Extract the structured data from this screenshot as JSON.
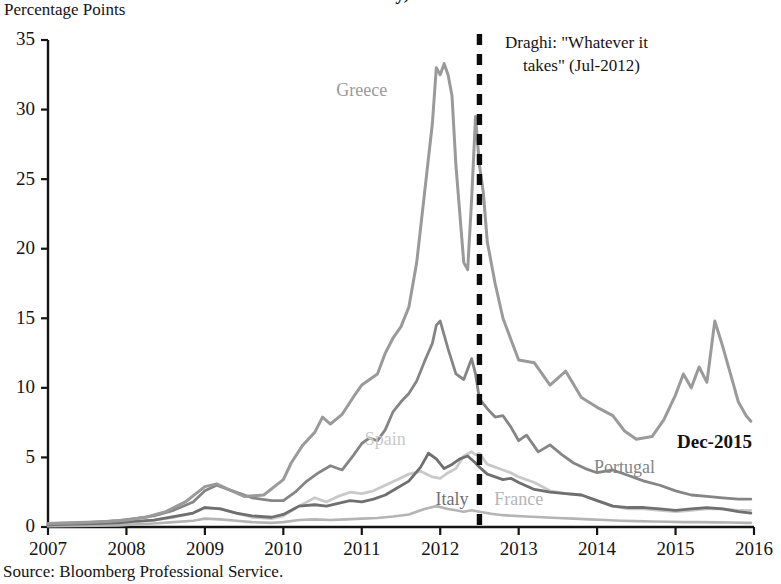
{
  "figure": {
    "title": "Over Germany, 2007–2015",
    "ylabel": "Percentage Points",
    "source_note": "Source: Bloomberg Professional Service."
  },
  "annotations": {
    "draghi_line1": "Draghi: \"Whatever it",
    "draghi_line2": "takes\" (Jul-2012)",
    "end_label": "Dec-2015"
  },
  "colors": {
    "greece": "#9a9a9a",
    "portugal": "#858585",
    "spain": "#c9c9c9",
    "italy": "#6f6f6f",
    "france": "#b4b4b4",
    "axis": "#141414",
    "event_line": "#0c0c0c",
    "background": "#ffffff"
  },
  "chart_data": {
    "type": "line",
    "title": "Over Germany, 2007–2015",
    "subtitle": "",
    "xlabel": "",
    "ylabel": "Percentage Points",
    "xlim": [
      2007,
      2016
    ],
    "ylim": [
      0,
      35
    ],
    "yticks": [
      0,
      5,
      10,
      15,
      20,
      25,
      30,
      35
    ],
    "xticks": [
      2007,
      2008,
      2009,
      2010,
      2011,
      2012,
      2013,
      2014,
      2015,
      2016
    ],
    "grid": false,
    "legend": "inline-labels",
    "annotations": [
      {
        "label": "Draghi: \"Whatever it takes\" (Jul-2012)",
        "x": 2012.5,
        "type": "vline-dashed"
      },
      {
        "label": "Dec-2015",
        "x": 2015.95,
        "y": 6.0,
        "type": "text"
      }
    ],
    "series": [
      {
        "name": "Greece",
        "color": "#9a9a9a",
        "label_x": 2011.0,
        "label_y": 31.0,
        "x": [
          2007.0,
          2007.25,
          2007.5,
          2007.75,
          2008.0,
          2008.25,
          2008.5,
          2008.75,
          2009.0,
          2009.15,
          2009.3,
          2009.5,
          2009.75,
          2010.0,
          2010.1,
          2010.25,
          2010.4,
          2010.5,
          2010.6,
          2010.75,
          2010.9,
          2011.0,
          2011.1,
          2011.2,
          2011.3,
          2011.4,
          2011.5,
          2011.6,
          2011.7,
          2011.8,
          2011.9,
          2011.95,
          2012.0,
          2012.05,
          2012.1,
          2012.15,
          2012.2,
          2012.3,
          2012.35,
          2012.4,
          2012.45,
          2012.5,
          2012.55,
          2012.6,
          2012.7,
          2012.8,
          2012.9,
          2013.0,
          2013.2,
          2013.4,
          2013.6,
          2013.8,
          2014.0,
          2014.2,
          2014.35,
          2014.5,
          2014.7,
          2014.85,
          2015.0,
          2015.1,
          2015.2,
          2015.3,
          2015.4,
          2015.5,
          2015.6,
          2015.7,
          2015.8,
          2015.9,
          2015.96
        ],
        "y": [
          0.25,
          0.3,
          0.35,
          0.4,
          0.5,
          0.7,
          1.1,
          1.8,
          2.9,
          3.1,
          2.7,
          2.2,
          2.3,
          3.4,
          4.6,
          5.9,
          6.8,
          7.9,
          7.4,
          8.1,
          9.4,
          10.2,
          10.6,
          11.0,
          12.5,
          13.6,
          14.4,
          15.8,
          19.0,
          24.0,
          29.0,
          33.0,
          32.5,
          33.3,
          32.5,
          31.0,
          26.0,
          19.0,
          18.5,
          23.5,
          29.5,
          26.0,
          24.0,
          20.5,
          17.5,
          15.0,
          13.5,
          12.0,
          11.8,
          10.2,
          11.2,
          9.3,
          8.6,
          8.0,
          6.9,
          6.3,
          6.5,
          7.7,
          9.5,
          11.0,
          10.0,
          11.5,
          10.4,
          14.8,
          13.0,
          11.0,
          9.0,
          8.0,
          7.6
        ]
      },
      {
        "name": "Portugal",
        "color": "#858585",
        "label_x": 2014.35,
        "label_y": 3.9,
        "x": [
          2007.0,
          2007.3,
          2007.6,
          2007.9,
          2008.1,
          2008.35,
          2008.6,
          2008.85,
          2009.0,
          2009.15,
          2009.35,
          2009.6,
          2009.85,
          2010.0,
          2010.15,
          2010.3,
          2010.45,
          2010.6,
          2010.75,
          2010.9,
          2011.0,
          2011.1,
          2011.2,
          2011.3,
          2011.4,
          2011.5,
          2011.6,
          2011.7,
          2011.8,
          2011.9,
          2011.95,
          2012.0,
          2012.1,
          2012.2,
          2012.3,
          2012.4,
          2012.45,
          2012.5,
          2012.6,
          2012.7,
          2012.8,
          2012.9,
          2013.0,
          2013.1,
          2013.25,
          2013.4,
          2013.55,
          2013.7,
          2013.85,
          2014.0,
          2014.2,
          2014.4,
          2014.6,
          2014.8,
          2015.0,
          2015.2,
          2015.4,
          2015.6,
          2015.8,
          2015.96
        ],
        "y": [
          0.2,
          0.25,
          0.35,
          0.45,
          0.6,
          0.8,
          1.2,
          1.8,
          2.6,
          3.0,
          2.6,
          2.1,
          1.9,
          1.9,
          2.5,
          3.3,
          3.9,
          4.4,
          4.1,
          5.2,
          6.0,
          6.4,
          6.2,
          7.0,
          8.3,
          9.0,
          9.6,
          10.5,
          11.9,
          13.2,
          14.5,
          14.8,
          12.8,
          11.0,
          10.6,
          12.1,
          11.0,
          9.2,
          8.5,
          7.9,
          8.0,
          7.2,
          6.2,
          6.6,
          5.4,
          5.9,
          5.2,
          4.6,
          4.2,
          3.9,
          4.1,
          3.7,
          3.3,
          3.0,
          2.6,
          2.3,
          2.2,
          2.1,
          2.0,
          2.0
        ]
      },
      {
        "name": "Spain",
        "color": "#c9c9c9",
        "label_x": 2011.3,
        "label_y": 5.9,
        "x": [
          2007.0,
          2007.3,
          2007.6,
          2007.9,
          2008.1,
          2008.35,
          2008.6,
          2008.85,
          2009.0,
          2009.2,
          2009.4,
          2009.6,
          2009.85,
          2010.0,
          2010.2,
          2010.4,
          2010.55,
          2010.7,
          2010.85,
          2011.0,
          2011.15,
          2011.3,
          2011.45,
          2011.6,
          2011.75,
          2011.9,
          2012.0,
          2012.1,
          2012.2,
          2012.3,
          2012.4,
          2012.45,
          2012.5,
          2012.6,
          2012.7,
          2012.8,
          2012.9,
          2013.0,
          2013.2,
          2013.4,
          2013.6,
          2013.8,
          2014.0,
          2014.2,
          2014.4,
          2014.6,
          2014.8,
          2015.0,
          2015.2,
          2015.4,
          2015.6,
          2015.8,
          2015.96
        ],
        "y": [
          0.1,
          0.15,
          0.2,
          0.25,
          0.35,
          0.5,
          0.7,
          1.0,
          1.4,
          1.3,
          1.0,
          0.7,
          0.6,
          0.8,
          1.5,
          2.1,
          1.8,
          2.2,
          2.5,
          2.4,
          2.6,
          3.0,
          3.4,
          3.8,
          4.0,
          3.6,
          3.5,
          3.9,
          4.2,
          5.1,
          5.4,
          5.2,
          5.3,
          4.5,
          4.3,
          4.1,
          3.9,
          3.6,
          3.2,
          2.6,
          2.4,
          2.3,
          1.9,
          1.5,
          1.3,
          1.3,
          1.2,
          1.1,
          1.2,
          1.3,
          1.3,
          1.2,
          1.2
        ]
      },
      {
        "name": "Italy",
        "color": "#6f6f6f",
        "label_x": 2012.15,
        "label_y": 1.6,
        "x": [
          2007.0,
          2007.3,
          2007.6,
          2007.9,
          2008.1,
          2008.35,
          2008.6,
          2008.85,
          2009.0,
          2009.2,
          2009.4,
          2009.6,
          2009.85,
          2010.0,
          2010.2,
          2010.4,
          2010.55,
          2010.7,
          2010.85,
          2011.0,
          2011.15,
          2011.3,
          2011.45,
          2011.6,
          2011.75,
          2011.85,
          2011.95,
          2012.05,
          2012.15,
          2012.25,
          2012.35,
          2012.45,
          2012.5,
          2012.6,
          2012.7,
          2012.8,
          2012.9,
          2013.0,
          2013.2,
          2013.4,
          2013.6,
          2013.8,
          2014.0,
          2014.2,
          2014.4,
          2014.6,
          2014.8,
          2015.0,
          2015.2,
          2015.4,
          2015.6,
          2015.8,
          2015.96
        ],
        "y": [
          0.15,
          0.2,
          0.25,
          0.3,
          0.4,
          0.5,
          0.75,
          1.0,
          1.4,
          1.3,
          1.0,
          0.8,
          0.7,
          0.9,
          1.5,
          1.6,
          1.5,
          1.7,
          1.9,
          1.8,
          2.0,
          2.3,
          2.8,
          3.3,
          4.3,
          5.3,
          4.9,
          4.2,
          4.5,
          4.9,
          5.1,
          4.6,
          4.3,
          3.8,
          3.6,
          3.4,
          3.5,
          3.2,
          2.7,
          2.5,
          2.4,
          2.3,
          1.9,
          1.5,
          1.4,
          1.4,
          1.3,
          1.2,
          1.3,
          1.4,
          1.3,
          1.1,
          1.0
        ]
      },
      {
        "name": "France",
        "color": "#b4b4b4",
        "label_x": 2013.0,
        "label_y": 1.55,
        "x": [
          2007.0,
          2007.3,
          2007.6,
          2007.9,
          2008.1,
          2008.35,
          2008.6,
          2008.85,
          2009.0,
          2009.2,
          2009.4,
          2009.6,
          2009.85,
          2010.0,
          2010.2,
          2010.4,
          2010.6,
          2010.8,
          2011.0,
          2011.2,
          2011.4,
          2011.6,
          2011.8,
          2011.95,
          2012.1,
          2012.2,
          2012.3,
          2012.4,
          2012.5,
          2012.65,
          2012.8,
          2012.95,
          2013.1,
          2013.3,
          2013.5,
          2013.7,
          2013.9,
          2014.1,
          2014.3,
          2014.5,
          2014.7,
          2014.9,
          2015.1,
          2015.3,
          2015.5,
          2015.7,
          2015.9,
          2015.96
        ],
        "y": [
          0.05,
          0.08,
          0.1,
          0.12,
          0.18,
          0.25,
          0.35,
          0.45,
          0.6,
          0.55,
          0.45,
          0.35,
          0.3,
          0.35,
          0.5,
          0.55,
          0.5,
          0.55,
          0.6,
          0.65,
          0.75,
          0.9,
          1.3,
          1.5,
          1.3,
          1.2,
          1.1,
          1.2,
          1.1,
          0.95,
          0.85,
          0.8,
          0.75,
          0.7,
          0.65,
          0.6,
          0.55,
          0.5,
          0.45,
          0.42,
          0.4,
          0.38,
          0.35,
          0.35,
          0.33,
          0.32,
          0.3,
          0.3
        ]
      }
    ]
  }
}
